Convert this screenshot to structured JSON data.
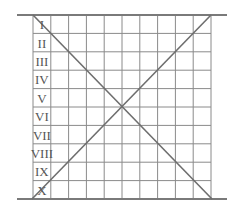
{
  "diagram": {
    "rows": [
      "I",
      "II",
      "III",
      "IV",
      "V",
      "VI",
      "VII",
      "VIII",
      "IX",
      "X"
    ],
    "columns": 10,
    "colors": {
      "grid": "#8a8a8a",
      "diagonal": "#6e6e6e",
      "rule": "#7a7a7a",
      "text": "#555555"
    }
  }
}
